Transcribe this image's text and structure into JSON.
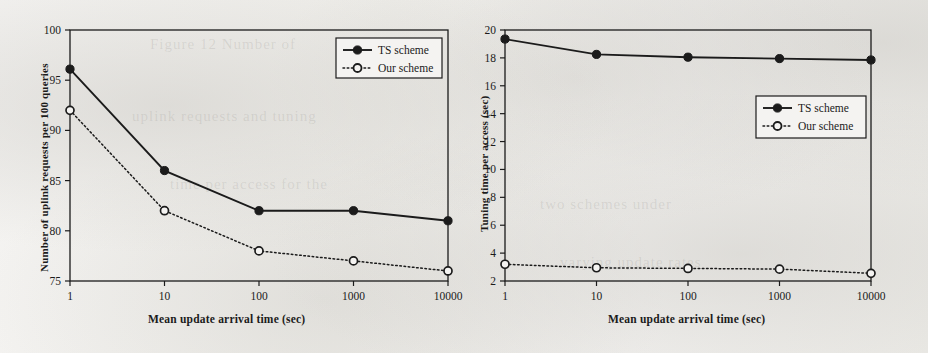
{
  "page": {
    "background_color": "#f2f1ef",
    "ink_color": "#1b1b1b",
    "bleed_text": [
      "Figure 12  Number of",
      "uplink requests and tuning",
      "time per access for the",
      "two schemes under",
      "varying update rates"
    ]
  },
  "chart_data": [
    {
      "id": "left",
      "type": "line",
      "title": "",
      "xlabel": "Mean update arrival time (sec)",
      "ylabel": "Number of uplink requests per 100 queries",
      "x": [
        1,
        10,
        100,
        1000,
        10000
      ],
      "xtick_labels": [
        "1",
        "10",
        "100",
        "1000",
        "10000"
      ],
      "xscale": "log",
      "ylim": [
        75,
        100
      ],
      "ytick_labels": [
        "75",
        "80",
        "85",
        "90",
        "95",
        "100"
      ],
      "yticks": [
        75,
        80,
        85,
        90,
        95,
        100
      ],
      "grid": false,
      "legend_position": "top-right",
      "series": [
        {
          "name": "TS scheme",
          "marker": "filled-circle",
          "line": "solid",
          "color": "#1b1b1b",
          "values": [
            96.1,
            86.0,
            82.0,
            82.0,
            81.0
          ]
        },
        {
          "name": "Our scheme",
          "marker": "open-circle",
          "line": "dotted",
          "color": "#1b1b1b",
          "values": [
            92.0,
            82.0,
            78.0,
            77.0,
            76.0
          ]
        }
      ]
    },
    {
      "id": "right",
      "type": "line",
      "title": "",
      "xlabel": "Mean update arrival time (sec)",
      "ylabel": "Tuning time per access (sec)",
      "x": [
        1,
        10,
        100,
        1000,
        10000
      ],
      "xtick_labels": [
        "1",
        "10",
        "100",
        "1000",
        "10000"
      ],
      "xscale": "log",
      "ylim": [
        2,
        20
      ],
      "ytick_labels": [
        "2",
        "4",
        "6",
        "8",
        "10",
        "12",
        "14",
        "16",
        "18",
        "20"
      ],
      "yticks": [
        2,
        4,
        6,
        8,
        10,
        12,
        14,
        16,
        18,
        20
      ],
      "grid": false,
      "legend_position": "right-upper",
      "series": [
        {
          "name": "TS scheme",
          "marker": "filled-circle",
          "line": "solid",
          "color": "#1b1b1b",
          "values": [
            19.35,
            18.25,
            18.05,
            17.95,
            17.85
          ]
        },
        {
          "name": "Our scheme",
          "marker": "open-circle",
          "line": "dotted",
          "color": "#1b1b1b",
          "values": [
            3.2,
            2.95,
            2.9,
            2.85,
            2.55
          ]
        }
      ]
    }
  ]
}
